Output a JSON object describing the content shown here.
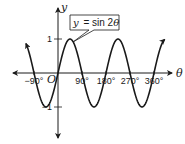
{
  "chart_data": {
    "type": "line",
    "title": "",
    "equation": {
      "lhs": "y",
      "rhs_prefix": "= sin 2",
      "rhs_var": "θ"
    },
    "function": "sin(2θ)",
    "xlabel": "θ",
    "ylabel": "y",
    "origin_label": "O",
    "x_unit": "degrees",
    "x_domain": [
      -120,
      400
    ],
    "xlim": [
      -180,
      420
    ],
    "ylim": [
      -2,
      2
    ],
    "x_ticks": [
      {
        "value": -90,
        "label": "−90°"
      },
      {
        "value": 90,
        "label": "90°"
      },
      {
        "value": 180,
        "label": "180°"
      },
      {
        "value": 270,
        "label": "270°"
      },
      {
        "value": 360,
        "label": "360°"
      }
    ],
    "y_ticks": [
      {
        "value": 1,
        "label": "1"
      },
      {
        "value": -1,
        "label": "−1"
      }
    ],
    "grid": false,
    "series": [
      {
        "name": "y = sin 2θ",
        "arrows_both_ends": true
      }
    ]
  }
}
